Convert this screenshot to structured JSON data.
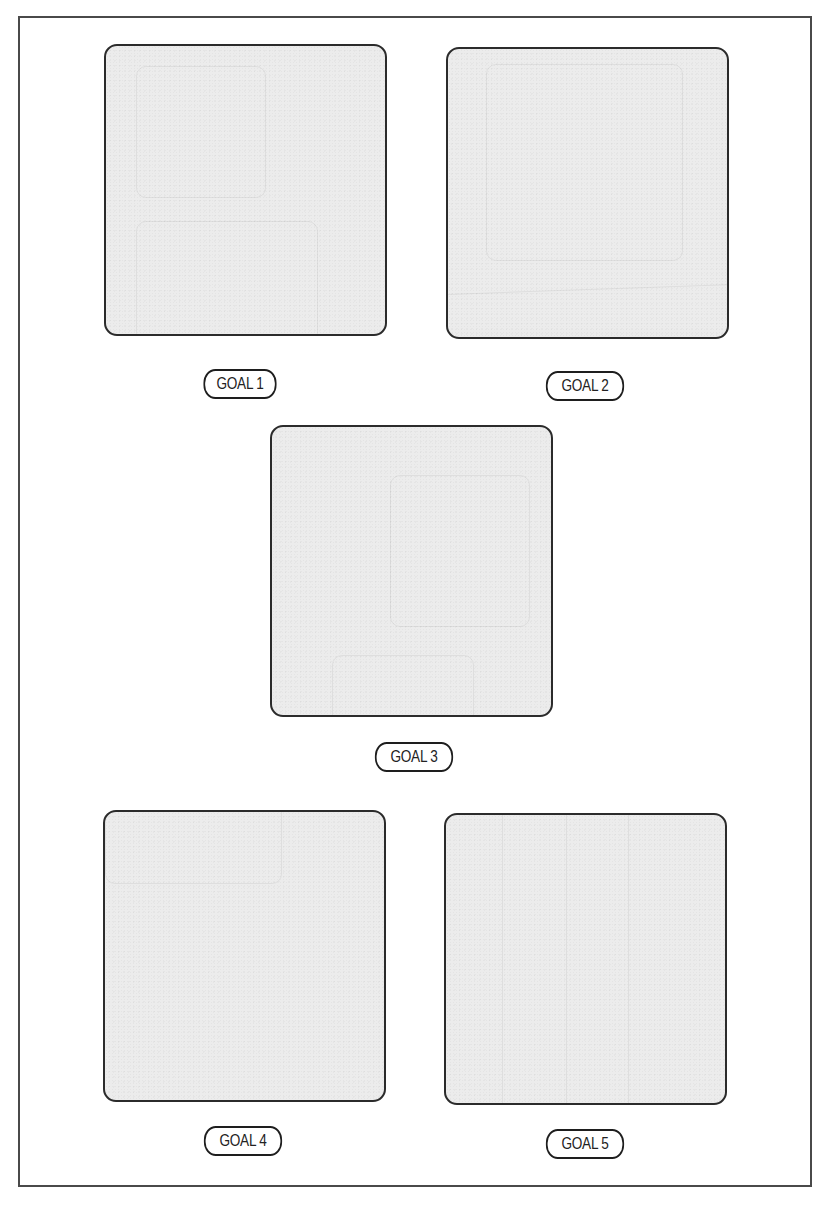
{
  "diagram": {
    "colors": {
      "frame_border": "#4a4a4a",
      "box_border": "#2b2b2b",
      "box_fill": "#ececec",
      "label_border": "#1e1e1e",
      "label_text": "#222222",
      "background": "#ffffff"
    },
    "goals": [
      {
        "label": "GOAL 1"
      },
      {
        "label": "GOAL 2"
      },
      {
        "label": "GOAL 3"
      },
      {
        "label": "GOAL 4"
      },
      {
        "label": "GOAL 5"
      }
    ]
  }
}
